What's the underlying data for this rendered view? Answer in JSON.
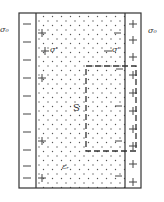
{
  "diagram": {
    "labels": {
      "left_plate_charge": "σ₀",
      "left_plate_sign": "−",
      "right_plate_charge": "σ₀",
      "right_plate_sign": "+",
      "bound_charge_left": "σ'",
      "bound_charge_right": "σ'",
      "gaussian_surface": "S",
      "permittivity": "εᵣ"
    },
    "left_plate_signs": [
      "−",
      "−",
      "−",
      "−",
      "−",
      "−",
      "−",
      "−",
      "−",
      "−"
    ],
    "right_plate_signs": [
      "+",
      "+",
      "+",
      "+",
      "+",
      "+",
      "+",
      "+",
      "+",
      "+"
    ],
    "colors": {
      "line": "#333333",
      "dots": "#555555",
      "background": "#ffffff"
    }
  }
}
